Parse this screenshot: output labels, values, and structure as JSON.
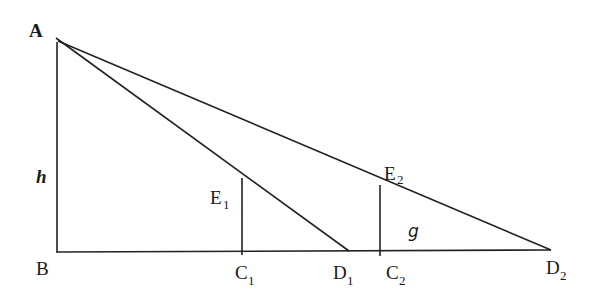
{
  "diagram": {
    "type": "geometry",
    "points": {
      "A": {
        "label": "A",
        "x": 57,
        "y": 40
      },
      "B": {
        "label": "B",
        "x": 57,
        "y": 252
      },
      "C1": {
        "label": "C",
        "sub": "1",
        "x": 242,
        "y": 252
      },
      "E1": {
        "label": "E",
        "sub": "1",
        "x": 242,
        "y": 178
      },
      "D1": {
        "label": "D",
        "sub": "1",
        "x": 349,
        "y": 252
      },
      "C2": {
        "label": "C",
        "sub": "2",
        "x": 380,
        "y": 252
      },
      "E2": {
        "label": "E",
        "sub": "2",
        "x": 380,
        "y": 185
      },
      "D2": {
        "label": "D",
        "sub": "2",
        "x": 551,
        "y": 252
      }
    },
    "labels": {
      "A": "A",
      "B": "B",
      "h": "h",
      "g": "g",
      "C": "C",
      "D": "D",
      "E": "E",
      "sub1": "1",
      "sub2": "2"
    },
    "segments": [
      [
        "A",
        "B"
      ],
      [
        "B",
        "D2"
      ],
      [
        "A",
        "D1"
      ],
      [
        "A",
        "D2"
      ],
      [
        "C1",
        "E1"
      ],
      [
        "C2",
        "E2"
      ]
    ],
    "colors": {
      "stroke": "#222222",
      "text": "#1a1a1a",
      "background": "#ffffff"
    }
  }
}
